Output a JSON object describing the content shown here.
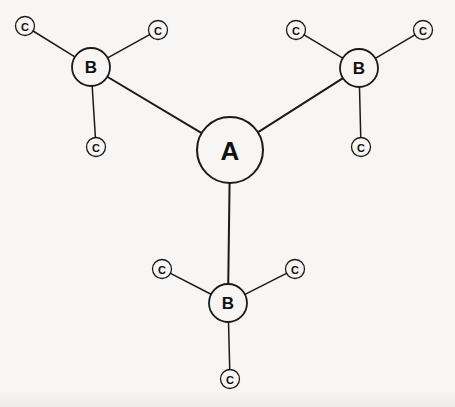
{
  "diagram": {
    "type": "node-link-graph",
    "title": "",
    "background_color": "#f7f6f4",
    "stroke_color": "#1a1a1a",
    "label_color": "#111111",
    "nodes": [
      {
        "id": "A",
        "label": "A",
        "kind": "center",
        "cx": 230,
        "cy": 150,
        "r": 33,
        "stroke_width": 2.0,
        "label_class": "label-a"
      },
      {
        "id": "B1",
        "label": "B",
        "kind": "branch",
        "cx": 91,
        "cy": 67,
        "r": 19,
        "stroke_width": 1.8,
        "label_class": "label-b"
      },
      {
        "id": "B2",
        "label": "B",
        "kind": "branch",
        "cx": 359,
        "cy": 68,
        "r": 19,
        "stroke_width": 1.8,
        "label_class": "label-b"
      },
      {
        "id": "B3",
        "label": "B",
        "kind": "branch",
        "cx": 228,
        "cy": 303,
        "r": 19,
        "stroke_width": 1.8,
        "label_class": "label-b"
      },
      {
        "id": "C11",
        "label": "C",
        "kind": "leaf",
        "cx": 25,
        "cy": 26,
        "r": 9.5,
        "stroke_width": 1.3,
        "label_class": "label-c"
      },
      {
        "id": "C12",
        "label": "C",
        "kind": "leaf",
        "cx": 158,
        "cy": 30,
        "r": 9.5,
        "stroke_width": 1.3,
        "label_class": "label-c"
      },
      {
        "id": "C13",
        "label": "C",
        "kind": "leaf",
        "cx": 96,
        "cy": 147,
        "r": 9.5,
        "stroke_width": 1.3,
        "label_class": "label-c"
      },
      {
        "id": "C21",
        "label": "C",
        "kind": "leaf",
        "cx": 296,
        "cy": 30,
        "r": 9.5,
        "stroke_width": 1.3,
        "label_class": "label-c"
      },
      {
        "id": "C22",
        "label": "C",
        "kind": "leaf",
        "cx": 423,
        "cy": 30,
        "r": 9.5,
        "stroke_width": 1.3,
        "label_class": "label-c"
      },
      {
        "id": "C23",
        "label": "C",
        "kind": "leaf",
        "cx": 361,
        "cy": 147,
        "r": 9.5,
        "stroke_width": 1.3,
        "label_class": "label-c"
      },
      {
        "id": "C31",
        "label": "C",
        "kind": "leaf",
        "cx": 162,
        "cy": 269,
        "r": 9.5,
        "stroke_width": 1.3,
        "label_class": "label-c"
      },
      {
        "id": "C32",
        "label": "C",
        "kind": "leaf",
        "cx": 295,
        "cy": 269,
        "r": 9.5,
        "stroke_width": 1.3,
        "label_class": "label-c"
      },
      {
        "id": "C33",
        "label": "C",
        "kind": "leaf",
        "cx": 230,
        "cy": 379,
        "r": 9.5,
        "stroke_width": 1.3,
        "label_class": "label-c"
      }
    ],
    "edges": [
      {
        "from": "A",
        "to": "B1",
        "stroke_width": 2.0
      },
      {
        "from": "A",
        "to": "B2",
        "stroke_width": 2.0
      },
      {
        "from": "A",
        "to": "B3",
        "stroke_width": 2.0
      },
      {
        "from": "B1",
        "to": "C11",
        "stroke_width": 1.5
      },
      {
        "from": "B1",
        "to": "C12",
        "stroke_width": 1.5
      },
      {
        "from": "B1",
        "to": "C13",
        "stroke_width": 1.5
      },
      {
        "from": "B2",
        "to": "C21",
        "stroke_width": 1.5
      },
      {
        "from": "B2",
        "to": "C22",
        "stroke_width": 1.5
      },
      {
        "from": "B2",
        "to": "C23",
        "stroke_width": 1.5
      },
      {
        "from": "B3",
        "to": "C31",
        "stroke_width": 1.5
      },
      {
        "from": "B3",
        "to": "C32",
        "stroke_width": 1.5
      },
      {
        "from": "B3",
        "to": "C33",
        "stroke_width": 1.5
      }
    ]
  }
}
